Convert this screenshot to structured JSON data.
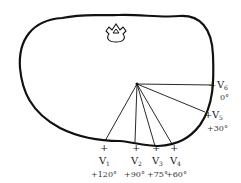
{
  "diagram": {
    "type": "thorax-cross-section-precordial-leads",
    "center": {
      "x": 137,
      "y": 84
    },
    "leads": [
      {
        "name": "V",
        "sub": "6",
        "angle": "0°",
        "end": [
          213,
          85
        ],
        "plus": [
          213,
          85
        ],
        "label": [
          218,
          88
        ],
        "angle_pos": [
          221,
          100
        ]
      },
      {
        "name": "V",
        "sub": "5",
        "angle": "+30°",
        "end": [
          205,
          112
        ],
        "plus": [
          209,
          115
        ],
        "label": [
          213,
          118
        ],
        "angle_pos": [
          213,
          130
        ]
      },
      {
        "name": "V",
        "sub": "1",
        "angle": "+120°",
        "end": [
          105,
          141
        ],
        "plus": [
          103,
          147
        ],
        "label": [
          99,
          162
        ],
        "angle_pos": [
          92,
          175
        ]
      },
      {
        "name": "V",
        "sub": "2",
        "angle": "+90°",
        "end": [
          135,
          142
        ],
        "plus": [
          135,
          149
        ],
        "label": [
          131,
          162
        ],
        "angle_pos": [
          124,
          175
        ]
      },
      {
        "name": "V",
        "sub": "3",
        "angle": "+75°",
        "end": [
          155,
          146
        ],
        "plus": [
          155,
          150
        ],
        "label": [
          152,
          162
        ],
        "angle_pos": [
          148,
          175
        ]
      },
      {
        "name": "V",
        "sub": "4",
        "angle": "+60°",
        "end": [
          172,
          144
        ],
        "plus": [
          174,
          150
        ],
        "label": [
          170,
          162
        ],
        "angle_pos": [
          166,
          175
        ]
      }
    ]
  }
}
